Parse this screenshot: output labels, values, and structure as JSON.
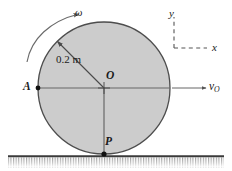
{
  "figure": {
    "background_color": "#ffffff",
    "disk": {
      "fill_color": "#cccccc",
      "stroke_color": "#4d4d4d",
      "center_x": 104,
      "center_y": 88,
      "radius": 66,
      "radius_label": "0.2 m"
    },
    "points": [
      {
        "name": "O",
        "label": "O",
        "x": 104,
        "y": 88,
        "description": "center of disk"
      },
      {
        "name": "A",
        "label": "A",
        "x": 38,
        "y": 88,
        "description": "leftmost point on rim"
      },
      {
        "name": "P",
        "label": "P",
        "x": 104,
        "y": 154,
        "description": "contact point with ground"
      }
    ],
    "angular_velocity": {
      "symbol": "ω",
      "direction": "clockwise",
      "description": "curved arrow above upper-left of disk"
    },
    "velocity": {
      "symbol": "v",
      "subscript": "O",
      "direction": "rightward",
      "description": "horizontal arrow from right rim of disk"
    },
    "axes": {
      "x_label": "x",
      "y_label": "y",
      "style": "dashed",
      "corner_x": 174,
      "corner_y": 48
    },
    "ground": {
      "description": "hatched horizontal surface",
      "line_color": "#3a3a3a",
      "left": 8,
      "right": 224,
      "top_y": 156
    }
  }
}
